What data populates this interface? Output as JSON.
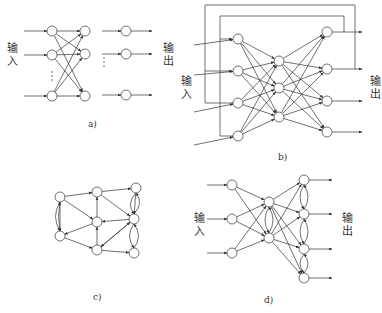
{
  "panels": {
    "a": {
      "caption": "a)",
      "input_label": [
        "输",
        "入"
      ],
      "output_label": [
        "输",
        "出"
      ],
      "ellipsis": "⋮",
      "layers": [
        [
          [
            52,
            31
          ],
          [
            52,
            55
          ],
          [
            52,
            96
          ]
        ],
        [
          [
            85,
            31
          ],
          [
            85,
            54
          ],
          [
            85,
            96
          ]
        ],
        [
          [
            126,
            31
          ],
          [
            126,
            54
          ],
          [
            126,
            95
          ]
        ]
      ]
    },
    "b": {
      "caption": "b)",
      "input_label": [
        "输",
        "入"
      ],
      "output_label": [
        "输",
        "出"
      ],
      "layers": [
        [
          [
            238,
            39
          ],
          [
            238,
            71
          ],
          [
            238,
            103
          ],
          [
            238,
            136
          ]
        ],
        [
          [
            279,
            61
          ],
          [
            279,
            88
          ],
          [
            279,
            117
          ]
        ],
        [
          [
            327,
            32
          ],
          [
            327,
            69
          ],
          [
            327,
            101
          ],
          [
            327,
            132
          ]
        ]
      ]
    },
    "c": {
      "caption": "c)",
      "nodes": [
        [
          60,
          197
        ],
        [
          97,
          192
        ],
        [
          97,
          222
        ],
        [
          60,
          236
        ],
        [
          97,
          250
        ],
        [
          136,
          188
        ],
        [
          134,
          219
        ],
        [
          134,
          253
        ]
      ]
    },
    "d": {
      "caption": "d)",
      "input_label": [
        "输",
        "入"
      ],
      "output_label": [
        "输",
        "出"
      ],
      "layers": [
        [
          [
            232,
            185
          ],
          [
            232,
            219
          ],
          [
            232,
            253
          ]
        ],
        [
          [
            269,
            202
          ],
          [
            269,
            238
          ]
        ],
        [
          [
            304,
            180
          ],
          [
            304,
            214
          ],
          [
            304,
            249
          ],
          [
            304,
            278
          ]
        ]
      ]
    }
  },
  "colors": {
    "stroke": "#333333",
    "background": "#ffffff"
  }
}
